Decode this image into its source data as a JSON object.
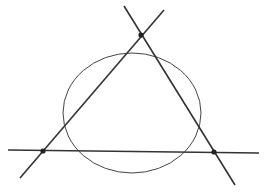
{
  "diagram": {
    "background": "#ffffff",
    "stroke_color": "#333333",
    "lines": [
      {
        "id": "horizontal-line",
        "x1": 8,
        "y1": 150,
        "x2": 259,
        "y2": 153
      },
      {
        "id": "left-line",
        "x1": 20,
        "y1": 178,
        "x2": 164,
        "y2": 10
      },
      {
        "id": "right-line",
        "x1": 124,
        "y1": 6,
        "x2": 235,
        "y2": 185
      }
    ],
    "vertices": [
      {
        "id": "top-vertex",
        "cx": 141,
        "cy": 35
      },
      {
        "id": "left-vertex",
        "cx": 43,
        "cy": 151
      },
      {
        "id": "right-vertex",
        "cx": 214,
        "cy": 152
      }
    ],
    "ellipse": {
      "cx": 132,
      "cy": 113,
      "rx": 69,
      "ry": 60
    }
  }
}
